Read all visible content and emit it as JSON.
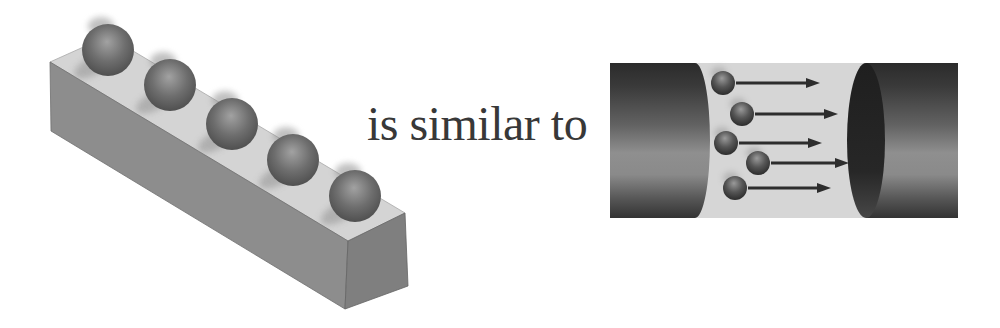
{
  "page": {
    "width": 1000,
    "height": 328,
    "background": "#ffffff"
  },
  "connector": {
    "text": "is similar to",
    "color": "#383838"
  },
  "left_figure": {
    "label": "spheres-resting-on-bar",
    "sphere_count": 5,
    "bar": {
      "top_color": "#d4d4d4",
      "front_color": "#8d8d8d",
      "end_color": "#7f7f7f",
      "edge_color": "#747474",
      "vertices": {
        "ftl": [
          50,
          62
        ],
        "btl": [
          108,
          36
        ],
        "ftr": [
          348,
          241
        ],
        "btr": [
          405,
          213
        ],
        "fbl": [
          51,
          131
        ],
        "fbr": [
          345,
          309
        ],
        "bbr": [
          408,
          286
        ]
      }
    },
    "spheres": {
      "radius": 26,
      "highlight_color": "#a2a2a2",
      "mid_color": "#6e6e6e",
      "edge_color": "#454545",
      "shadow_color": "#a6a6a6",
      "fuzz_color": "#8d8d8d",
      "centers": [
        [
          108,
          50
        ],
        [
          170,
          85
        ],
        [
          232,
          124
        ],
        [
          293,
          160
        ],
        [
          355,
          196
        ]
      ]
    }
  },
  "right_figure": {
    "label": "electrons-drifting-between-wire-ends",
    "electron_count": 5,
    "arrow_count": 5,
    "strip": {
      "x": 610,
      "y": 63,
      "width": 348,
      "height": 155,
      "fill": "#d6d6d6"
    },
    "left_wire": {
      "body_right": 695,
      "bulge_rx": 15
    },
    "right_wire": {
      "cap_cx": 866,
      "cap_rx": 19,
      "body_right": 958,
      "cap_colors": [
        "#1f1f1f",
        "#272727",
        "#474747"
      ]
    },
    "wire_gradient_colors": [
      "#2b2b2b",
      "#3a3a3a",
      "#626262",
      "#8f8f8f",
      "#8a8a8a",
      "#555555",
      "#333333"
    ],
    "electrons": {
      "radius": 12,
      "highlight_color": "#9a9a9a",
      "mid_color": "#565656",
      "edge_color": "#1c1c1c",
      "centers": [
        [
          723,
          83
        ],
        [
          742,
          114
        ],
        [
          726,
          143
        ],
        [
          758,
          163
        ],
        [
          735,
          188
        ]
      ]
    },
    "arrows": {
      "color": "#2d2d2d",
      "stroke_width": 3,
      "head_length": 14,
      "head_half_width": 5,
      "tips": [
        820,
        838,
        822,
        849,
        831
      ]
    }
  }
}
